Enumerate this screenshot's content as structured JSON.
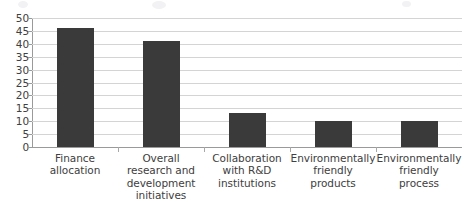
{
  "chart_data": {
    "type": "bar",
    "title": "",
    "subtitle": "",
    "xlabel": "",
    "ylabel": "",
    "categories": [
      "Finance allocation",
      "Overall research and development initiatives",
      "Collaboration with R&D institutions",
      "Environmentally friendly products",
      "Environmentally friendly process"
    ],
    "category_lines": [
      [
        "Finance",
        "allocation"
      ],
      [
        "Overall",
        "research and",
        "development",
        "initiatives"
      ],
      [
        "Collaboration",
        "with R&D",
        "institutions"
      ],
      [
        "Environmentally",
        "friendly",
        "products"
      ],
      [
        "Environmentally",
        "friendly",
        "process"
      ]
    ],
    "values": [
      46,
      41,
      13,
      10,
      10
    ],
    "ylim": [
      0,
      50
    ],
    "ytick_labels": [
      "0",
      "5",
      "10",
      "15",
      "20",
      "25",
      "30",
      "35",
      "40",
      "45",
      "50"
    ],
    "ytick_values": [
      0,
      5,
      10,
      15,
      20,
      25,
      30,
      35,
      40,
      45,
      50
    ],
    "grid": true,
    "legend": false,
    "legend_position": "none",
    "bar_color": "#3a3a3a",
    "gridline_color": "#d4d4d4",
    "axis_color": "#9a9a9a",
    "background_color": "#ffffff"
  }
}
